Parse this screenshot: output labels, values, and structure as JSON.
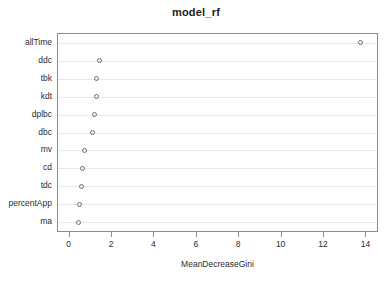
{
  "chart_data": {
    "type": "scatter",
    "title": "model_rf",
    "xlabel": "MeanDecreaseGini",
    "ylabel": "",
    "xlim": [
      -0.55,
      14.5
    ],
    "ylim_categories": 11,
    "grid": true,
    "grid_axis": "y",
    "legend": null,
    "marker": "open-circle",
    "categories": [
      "allTime",
      "ddc",
      "tbk",
      "kdt",
      "dplbc",
      "dbc",
      "mv",
      "cd",
      "tdc",
      "percentApp",
      "ma"
    ],
    "values": [
      13.7,
      1.4,
      1.25,
      1.25,
      1.15,
      1.1,
      0.7,
      0.6,
      0.55,
      0.45,
      0.4
    ],
    "points": [
      {
        "label": "allTime",
        "x": 13.7
      },
      {
        "label": "ddc",
        "x": 1.4
      },
      {
        "label": "tbk",
        "x": 1.25
      },
      {
        "label": "kdt",
        "x": 1.25
      },
      {
        "label": "dplbc",
        "x": 1.15
      },
      {
        "label": "dbc",
        "x": 1.1
      },
      {
        "label": "mv",
        "x": 0.7
      },
      {
        "label": "cd",
        "x": 0.6
      },
      {
        "label": "tdc",
        "x": 0.55
      },
      {
        "label": "percentApp",
        "x": 0.45
      },
      {
        "label": "ma",
        "x": 0.4
      }
    ],
    "xticks": [
      0,
      2,
      4,
      6,
      8,
      10,
      12,
      14
    ],
    "xtick_labels": [
      "0",
      "2",
      "4",
      "6",
      "8",
      "10",
      "12",
      "14"
    ],
    "colors": {
      "background": "#ffffff",
      "frame": "#8c8c8c",
      "grid": "#e8e8e8",
      "marker": "#6f6f6f",
      "text": "#2b2b2b"
    }
  }
}
